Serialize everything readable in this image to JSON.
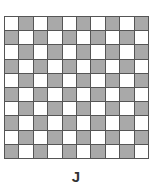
{
  "figure": {
    "label": "J",
    "grid": {
      "rows": 10,
      "cols": 10,
      "pattern": "checkerboard",
      "top_left": "white",
      "colors": {
        "white": "#ffffff",
        "shaded": "#a9a9a9",
        "border": "#555555"
      },
      "cells": [
        [
          0,
          1,
          0,
          1,
          0,
          1,
          0,
          1,
          0,
          1
        ],
        [
          1,
          0,
          1,
          0,
          1,
          0,
          1,
          0,
          1,
          0
        ],
        [
          0,
          1,
          0,
          1,
          0,
          1,
          0,
          1,
          0,
          1
        ],
        [
          1,
          0,
          1,
          0,
          1,
          0,
          1,
          0,
          1,
          0
        ],
        [
          0,
          1,
          0,
          1,
          0,
          1,
          0,
          1,
          0,
          1
        ],
        [
          1,
          0,
          1,
          0,
          1,
          0,
          1,
          0,
          1,
          0
        ],
        [
          0,
          1,
          0,
          1,
          0,
          1,
          0,
          1,
          0,
          1
        ],
        [
          1,
          0,
          1,
          0,
          1,
          0,
          1,
          0,
          1,
          0
        ],
        [
          0,
          1,
          0,
          1,
          0,
          1,
          0,
          1,
          0,
          1
        ],
        [
          1,
          0,
          1,
          0,
          1,
          0,
          1,
          0,
          1,
          0
        ]
      ]
    }
  }
}
